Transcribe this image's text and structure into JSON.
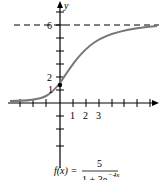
{
  "graph": {
    "axis_y_label": "y",
    "y_tick_labels": [
      "6",
      "2",
      "1"
    ],
    "x_tick_labels": [
      "1",
      "2",
      "3"
    ],
    "asymptote_value": 6,
    "y_intercept": 1.25,
    "curve_color": "#777777",
    "axis_color": "#000000"
  },
  "formula": {
    "lhs": "f(x) =",
    "numerator": "5",
    "denominator": "1 + 3e",
    "exponent": "−4x"
  }
}
